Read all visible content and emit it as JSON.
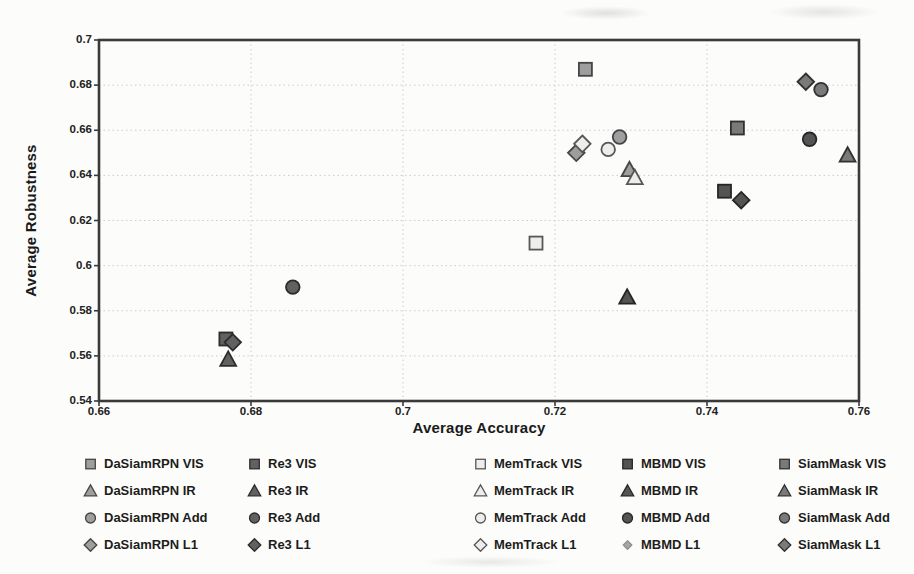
{
  "chart_data": {
    "type": "scatter",
    "title": "",
    "xlabel": "Average Accuracy",
    "ylabel": "Average Robustness",
    "xlim": [
      0.66,
      0.76
    ],
    "ylim": [
      0.54,
      0.7
    ],
    "grid": true,
    "legend_position": "bottom",
    "x_ticks": [
      {
        "v": 0.66,
        "label": "0.66"
      },
      {
        "v": 0.68,
        "label": "0.68"
      },
      {
        "v": 0.7,
        "label": "0.7"
      },
      {
        "v": 0.72,
        "label": "0.72"
      },
      {
        "v": 0.74,
        "label": "0.74"
      },
      {
        "v": 0.76,
        "label": "0.76"
      }
    ],
    "y_ticks": [
      {
        "v": 0.54,
        "label": "0.54"
      },
      {
        "v": 0.56,
        "label": "0.56"
      },
      {
        "v": 0.58,
        "label": "0.58"
      },
      {
        "v": 0.6,
        "label": "0.6"
      },
      {
        "v": 0.62,
        "label": "0.62"
      },
      {
        "v": 0.64,
        "label": "0.64"
      },
      {
        "v": 0.66,
        "label": "0.66"
      },
      {
        "v": 0.68,
        "label": "0.68"
      },
      {
        "v": 0.7,
        "label": "0.7"
      }
    ],
    "marker_map": {
      "VIS": "square",
      "IR": "triangle",
      "Add": "circle",
      "L1": "diamond"
    },
    "trackers": {
      "DaSiamRPN": {
        "fill": "#9e9e9e",
        "stroke": "#454545",
        "z": 0
      },
      "Re3": {
        "fill": "#616161",
        "stroke": "#2c2c2c",
        "z": 0
      },
      "MemTrack": {
        "fill": "#ededed",
        "stroke": "#575757",
        "z": 1
      },
      "MBMD": {
        "fill": "#545454",
        "stroke": "#262626",
        "z": 0
      },
      "SiamMask": {
        "fill": "#7a7a7a",
        "stroke": "#313131",
        "z": 0
      }
    },
    "series": [
      {
        "label": "DaSiamRPN VIS",
        "tracker": "DaSiamRPN",
        "modality": "VIS",
        "x": 0.724,
        "y": 0.687
      },
      {
        "label": "Re3 VIS",
        "tracker": "Re3",
        "modality": "VIS",
        "x": 0.6767,
        "y": 0.5675
      },
      {
        "label": "MemTrack VIS",
        "tracker": "MemTrack",
        "modality": "VIS",
        "x": 0.7175,
        "y": 0.61
      },
      {
        "label": "MBMD VIS",
        "tracker": "MBMD",
        "modality": "VIS",
        "x": 0.7423,
        "y": 0.633
      },
      {
        "label": "SiamMask VIS",
        "tracker": "SiamMask",
        "modality": "VIS",
        "x": 0.744,
        "y": 0.661
      },
      {
        "label": "DaSiamRPN IR",
        "tracker": "DaSiamRPN",
        "modality": "IR",
        "x": 0.7298,
        "y": 0.6425
      },
      {
        "label": "Re3 IR",
        "tracker": "Re3",
        "modality": "IR",
        "x": 0.677,
        "y": 0.5585
      },
      {
        "label": "MemTrack IR",
        "tracker": "MemTrack",
        "modality": "IR",
        "x": 0.7305,
        "y": 0.639
      },
      {
        "label": "MBMD IR",
        "tracker": "MBMD",
        "modality": "IR",
        "x": 0.7295,
        "y": 0.586
      },
      {
        "label": "SiamMask IR",
        "tracker": "SiamMask",
        "modality": "IR",
        "x": 0.7585,
        "y": 0.649
      },
      {
        "label": "DaSiamRPN Add",
        "tracker": "DaSiamRPN",
        "modality": "Add",
        "x": 0.7285,
        "y": 0.657
      },
      {
        "label": "Re3 Add",
        "tracker": "Re3",
        "modality": "Add",
        "x": 0.6855,
        "y": 0.5905
      },
      {
        "label": "MemTrack Add",
        "tracker": "MemTrack",
        "modality": "Add",
        "x": 0.727,
        "y": 0.6515
      },
      {
        "label": "MBMD Add",
        "tracker": "MBMD",
        "modality": "Add",
        "x": 0.7535,
        "y": 0.656
      },
      {
        "label": "SiamMask Add",
        "tracker": "SiamMask",
        "modality": "Add",
        "x": 0.755,
        "y": 0.678
      },
      {
        "label": "DaSiamRPN L1",
        "tracker": "DaSiamRPN",
        "modality": "L1",
        "x": 0.7228,
        "y": 0.65
      },
      {
        "label": "Re3 L1",
        "tracker": "Re3",
        "modality": "L1",
        "x": 0.6776,
        "y": 0.566
      },
      {
        "label": "MemTrack L1",
        "tracker": "MemTrack",
        "modality": "L1",
        "x": 0.7236,
        "y": 0.654
      },
      {
        "label": "MBMD L1",
        "tracker": "MBMD",
        "modality": "L1",
        "x": 0.7445,
        "y": 0.629,
        "legend_small": true
      },
      {
        "label": "SiamMask L1",
        "tracker": "SiamMask",
        "modality": "L1",
        "x": 0.753,
        "y": 0.6815
      }
    ],
    "colors": {
      "border": "#3a3a3a",
      "grid": "#cdcdcd",
      "tick": "#3a3a3a",
      "text": "#1e1e1e"
    }
  }
}
